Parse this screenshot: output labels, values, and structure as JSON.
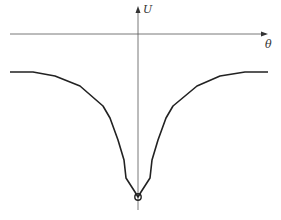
{
  "diagram": {
    "axes": {
      "x_label": "θ",
      "y_label": "U"
    },
    "curve": {
      "description": "Symmetric potential well U(θ) with minimum at θ = 0 marked by a small circle",
      "color": "#222222",
      "points": [
        [
          10,
          72
        ],
        [
          33,
          72
        ],
        [
          55,
          76
        ],
        [
          80,
          86
        ],
        [
          103,
          106
        ],
        [
          110,
          118
        ],
        [
          118,
          140
        ],
        [
          124,
          160
        ],
        [
          126,
          178
        ],
        [
          135,
          192
        ],
        [
          138,
          197
        ],
        [
          141,
          192
        ],
        [
          150,
          178
        ],
        [
          152,
          160
        ],
        [
          158,
          140
        ],
        [
          166,
          118
        ],
        [
          173,
          106
        ],
        [
          197,
          86
        ],
        [
          220,
          76
        ],
        [
          245,
          72
        ],
        [
          268,
          72
        ]
      ]
    },
    "minimum_marker": {
      "x": 138,
      "y": 197,
      "shape": "circle"
    }
  }
}
